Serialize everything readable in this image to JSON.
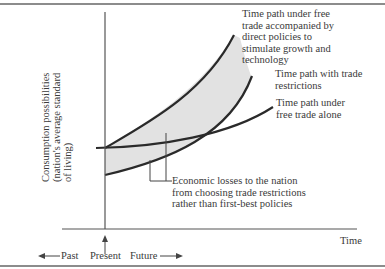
{
  "diagram": {
    "y_axis_label": [
      "Consumption possibilities",
      "(nation's average standard",
      "of living)"
    ],
    "x_axis_label": "Time",
    "timeline": {
      "past": "Past",
      "present": "Present",
      "future": "Future"
    },
    "curves": [
      {
        "name": "free-trade-with-policies",
        "label": [
          "Time path under free",
          "trade accompanied by",
          "direct policies to",
          "stimulate growth and",
          "technology"
        ]
      },
      {
        "name": "trade-restrictions",
        "label": [
          "Time path with trade",
          "restrictions"
        ]
      },
      {
        "name": "free-trade-alone",
        "label": [
          "Time path under",
          "free trade alone"
        ]
      }
    ],
    "annotation": [
      "Economic losses to the nation",
      "from choosing trade restrictions",
      "rather than first-best policies"
    ],
    "colors": {
      "line": "#2a2a2a",
      "shade": "#e4e4e4",
      "border": "#555555"
    }
  }
}
